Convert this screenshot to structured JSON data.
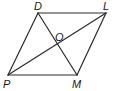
{
  "diagram": {
    "type": "parallelogram-with-diagonals",
    "vertices": {
      "D": {
        "label": "D",
        "x": 38,
        "y": 13
      },
      "L": {
        "label": "L",
        "x": 106,
        "y": 13
      },
      "M": {
        "label": "M",
        "x": 77,
        "y": 75
      },
      "P": {
        "label": "P",
        "x": 8,
        "y": 75
      },
      "O": {
        "label": "O",
        "x": 57,
        "y": 44
      }
    },
    "sides": [
      "DL",
      "LM",
      "MP",
      "PD"
    ],
    "diagonals": [
      "DM",
      "PL"
    ],
    "labels": {
      "D": "D",
      "L": "L",
      "O": "O",
      "P": "P",
      "M": "M"
    },
    "colors": {
      "stroke": "#2a2a2a",
      "text": "#1a1a1a",
      "background": "#ffffff"
    }
  }
}
